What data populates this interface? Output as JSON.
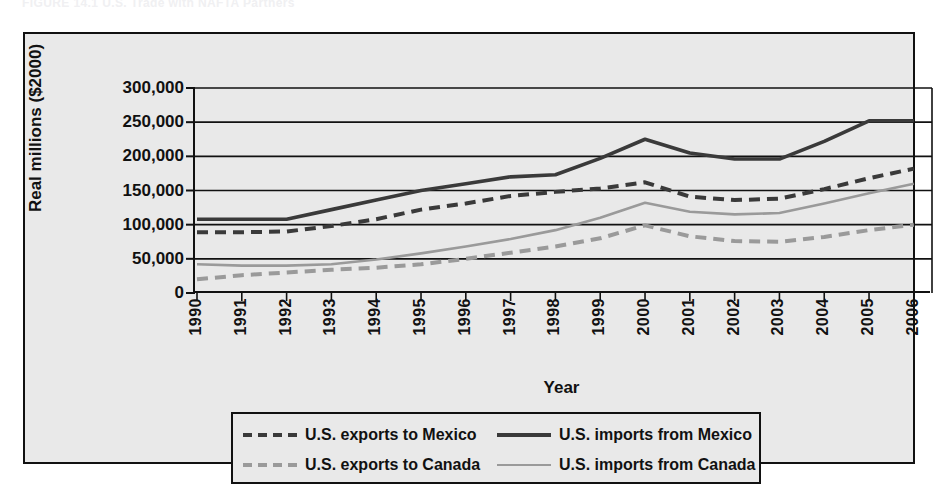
{
  "top_caption": "FIGURE 14.1    U.S. Trade with NAFTA Partners",
  "chart_data": {
    "type": "line",
    "title": "",
    "xlabel": "Year",
    "ylabel": "Real millions ($2000)",
    "categories": [
      "1990",
      "1991",
      "1992",
      "1993",
      "1994",
      "1995",
      "1996",
      "1997",
      "1998",
      "1999",
      "2000",
      "2001",
      "2002",
      "2003",
      "2004",
      "2005",
      "2006"
    ],
    "ylim": [
      0,
      300000
    ],
    "yticks": [
      0,
      50000,
      100000,
      150000,
      200000,
      250000,
      300000
    ],
    "ytick_labels": [
      "0",
      "50,000",
      "100,000",
      "150,000",
      "200,000",
      "250,000",
      "300,000"
    ],
    "grid": true,
    "legend_position": "below",
    "series": [
      {
        "name": "U.S. exports to Mexico",
        "style": "dashed",
        "color": "#3a3a3a",
        "width": 4,
        "values": [
          89000,
          89000,
          90000,
          98000,
          108000,
          122000,
          131000,
          142000,
          148000,
          153000,
          162000,
          141000,
          136000,
          138000,
          152000,
          168000,
          182000
        ]
      },
      {
        "name": "U.S. imports from Mexico",
        "style": "solid",
        "color": "#3a3a3a",
        "width": 3.6,
        "values": [
          108000,
          108000,
          108000,
          122000,
          136000,
          150000,
          160000,
          170000,
          173000,
          197000,
          225000,
          205000,
          196000,
          196000,
          222000,
          252000,
          252000
        ]
      },
      {
        "name": "U.S. exports to Canada",
        "style": "dashed",
        "color": "#9a9a9a",
        "width": 4,
        "values": [
          20000,
          26000,
          30000,
          34000,
          37000,
          42000,
          50000,
          59000,
          68000,
          80000,
          99000,
          83000,
          76000,
          75000,
          82000,
          92000,
          100000
        ]
      },
      {
        "name": "U.S. imports from Canada",
        "style": "solid",
        "color": "#9a9a9a",
        "width": 2.6,
        "values": [
          42000,
          40000,
          40000,
          42000,
          49000,
          58000,
          68000,
          79000,
          92000,
          110000,
          132000,
          119000,
          115000,
          117000,
          131000,
          146000,
          160000
        ]
      }
    ]
  },
  "legend": {
    "items": [
      {
        "label": "U.S. exports to Mexico",
        "style": "dashed",
        "color": "#3a3a3a"
      },
      {
        "label": "U.S. imports from Mexico",
        "style": "solid",
        "color": "#3a3a3a"
      },
      {
        "label": "U.S. exports to Canada",
        "style": "dashed",
        "color": "#9a9a9a"
      },
      {
        "label": "U.S. imports from Canada",
        "style": "solid",
        "color": "#9a9a9a"
      }
    ]
  }
}
